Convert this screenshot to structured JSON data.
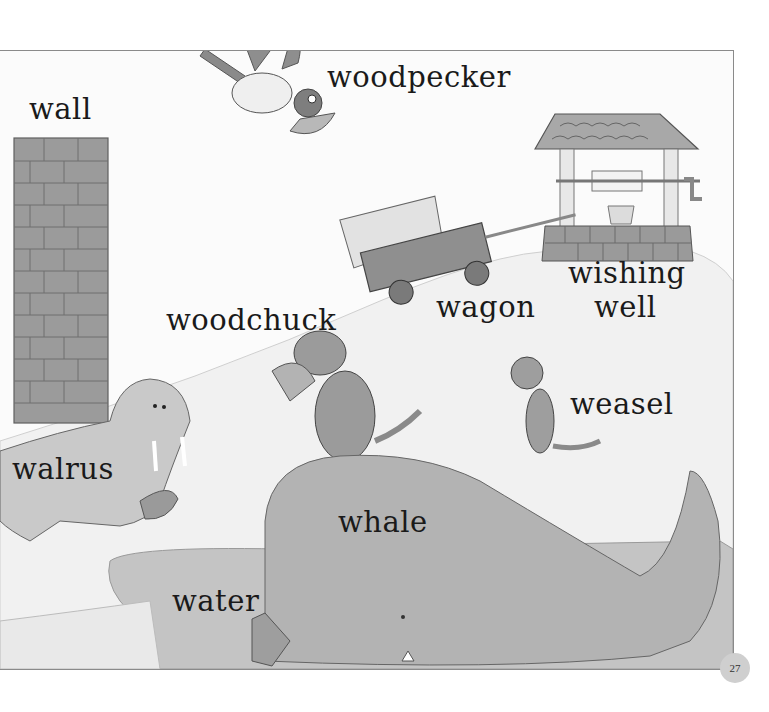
{
  "page": {
    "number": "27",
    "style": "grayscale children's picture dictionary illustration"
  },
  "labels": {
    "wall": "wall",
    "woodpecker": "woodpecker",
    "wishing_well": [
      "wishing",
      "well"
    ],
    "wagon": "wagon",
    "woodchuck": "woodchuck",
    "weasel": "weasel",
    "walrus": "walrus",
    "whale": "whale",
    "water": "water"
  },
  "colors": {
    "background": "#ffffff",
    "frame_border": "#8a8a8a",
    "ground": "#f2f2f2",
    "brick": "#9a9a9a",
    "animal_fill": "#b5b5b5",
    "water": "#c8c8c8",
    "page_badge": "#cfcfcf"
  }
}
